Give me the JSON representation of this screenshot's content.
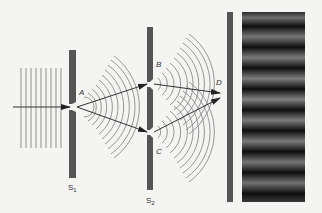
{
  "diagram": {
    "colors": {
      "background": "#f4f4f2",
      "barrier": "#555555",
      "wave": "#8a8a8a",
      "ray": "#333333",
      "fringe_dark": "#101010",
      "fringe_bright": "#7a7a7a"
    },
    "labels": {
      "A": "A",
      "B": "B",
      "C": "C",
      "D": "D",
      "S1_main": "S",
      "S1_sub": "1",
      "S2_main": "S",
      "S2_sub": "2"
    },
    "elements": {
      "plane_waves": {
        "count": 9,
        "x_start": 20,
        "x_end": 62,
        "y_top": 68,
        "y_bottom": 148
      },
      "barrier_s1": {
        "x": 69,
        "width": 7,
        "y_top": 50,
        "y_bottom": 178,
        "slit": "A",
        "slit_y": 107
      },
      "barrier_s2": {
        "x": 147,
        "width": 6,
        "y_top": 27,
        "y_bottom": 190,
        "slits": [
          {
            "name": "B",
            "y": 84
          },
          {
            "name": "C",
            "y": 132
          }
        ]
      },
      "screen": {
        "x": 227,
        "width": 6,
        "y_top": 12,
        "y_bottom": 202
      },
      "fringe_pattern": {
        "x": 242,
        "width": 63,
        "y_top": 12,
        "y_bottom": 202,
        "bright_bands": 9
      }
    }
  }
}
